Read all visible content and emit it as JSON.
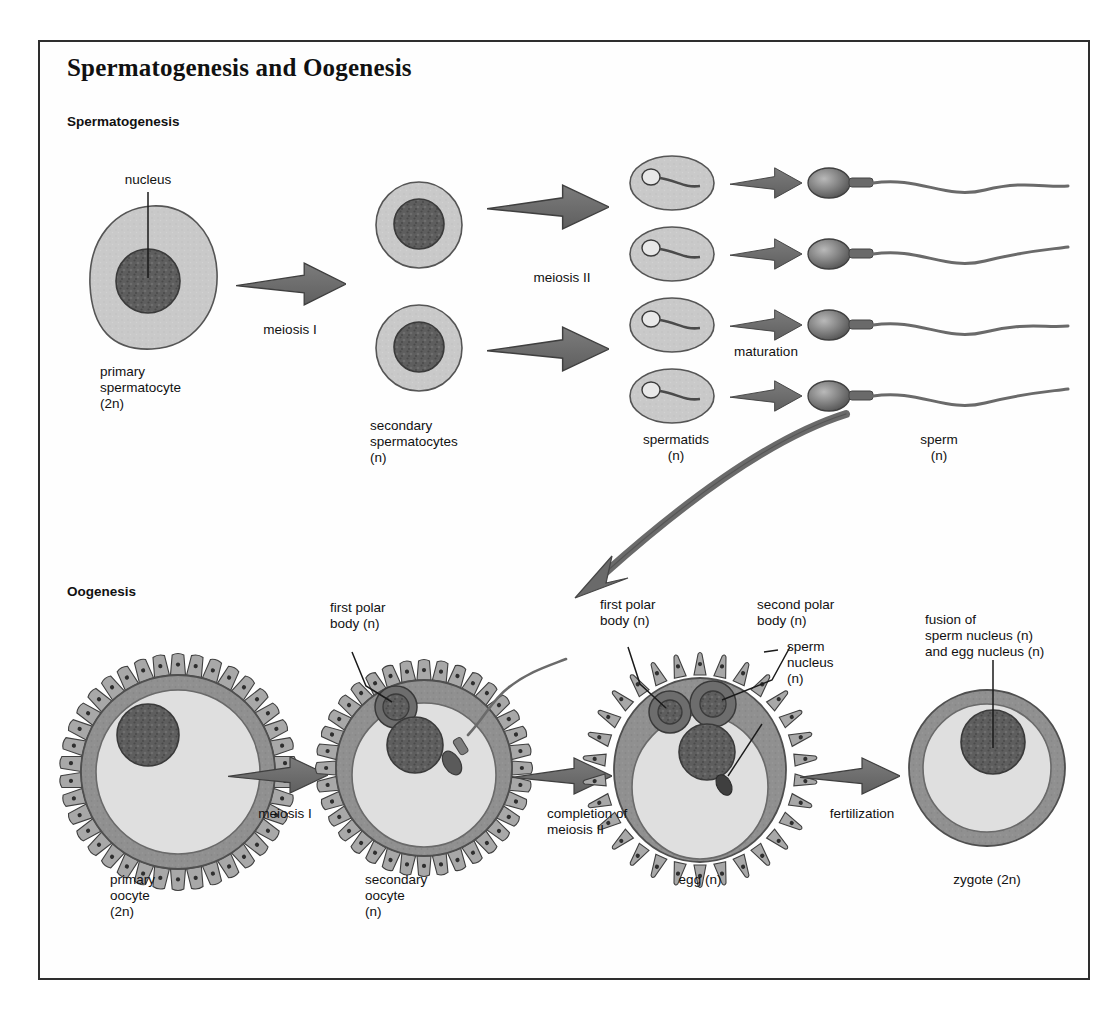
{
  "figure": {
    "title": "Spermatogenesis and Oogenesis",
    "frame_border_color": "#2e2e2e",
    "background": "#ffffff"
  },
  "palette": {
    "cytoplasm_light": "#c9c9c9",
    "cytoplasm_pale": "#dcdcdc",
    "zona_pellucida": "#8e8e8e",
    "nucleus_dark": "#5e5e5e",
    "nucleus_outline": "#3a3a3a",
    "arrow_gray": "#6e6e6e",
    "arrow_outline": "#3f3f3f",
    "text": "#111111",
    "leader_line": "#1a1a1a"
  },
  "sections": {
    "spermatogenesis": {
      "heading": "Spermatogenesis",
      "labels": {
        "nucleus": "nucleus",
        "primary_spermatocyte": "primary\nspermatocyte\n(2n)",
        "meiosis_1": "meiosis I",
        "secondary_spermatocytes": "secondary\nspermatocytes\n(n)",
        "meiosis_2": "meiosis II",
        "spermatids": "spermatids\n(n)",
        "maturation": "maturation",
        "sperm": "sperm\n(n)"
      },
      "counts": {
        "primary_spermatocyte": 1,
        "secondary_spermatocytes": 2,
        "spermatids": 4,
        "sperm": 4
      }
    },
    "oogenesis": {
      "heading": "Oogenesis",
      "labels": {
        "primary_oocyte": "primary\noocyte\n(2n)",
        "meiosis_1": "meiosis I",
        "first_polar_body_secondary": "first polar\nbody (n)",
        "secondary_oocyte": "secondary\noocyte\n(n)",
        "completion_meiosis_2": "completion of\nmeiosis II",
        "first_polar_body_egg": "first polar\nbody (n)",
        "second_polar_body": "second polar\nbody (n)",
        "sperm_nucleus": "sperm\nnucleus\n(n)",
        "egg": "egg (n)",
        "fertilization": "fertilization",
        "fusion": "fusion of\nsperm nucleus (n)\nand egg nucleus (n)",
        "zygote": "zygote (2n)"
      },
      "counts": {
        "polar_bodies_in_egg": 2
      }
    }
  },
  "icons": {
    "arrow": "block-arrow-icon",
    "curved_arrow": "curved-arrow-icon",
    "cell": "cell-icon",
    "sperm": "sperm-icon",
    "oocyte": "oocyte-icon"
  }
}
